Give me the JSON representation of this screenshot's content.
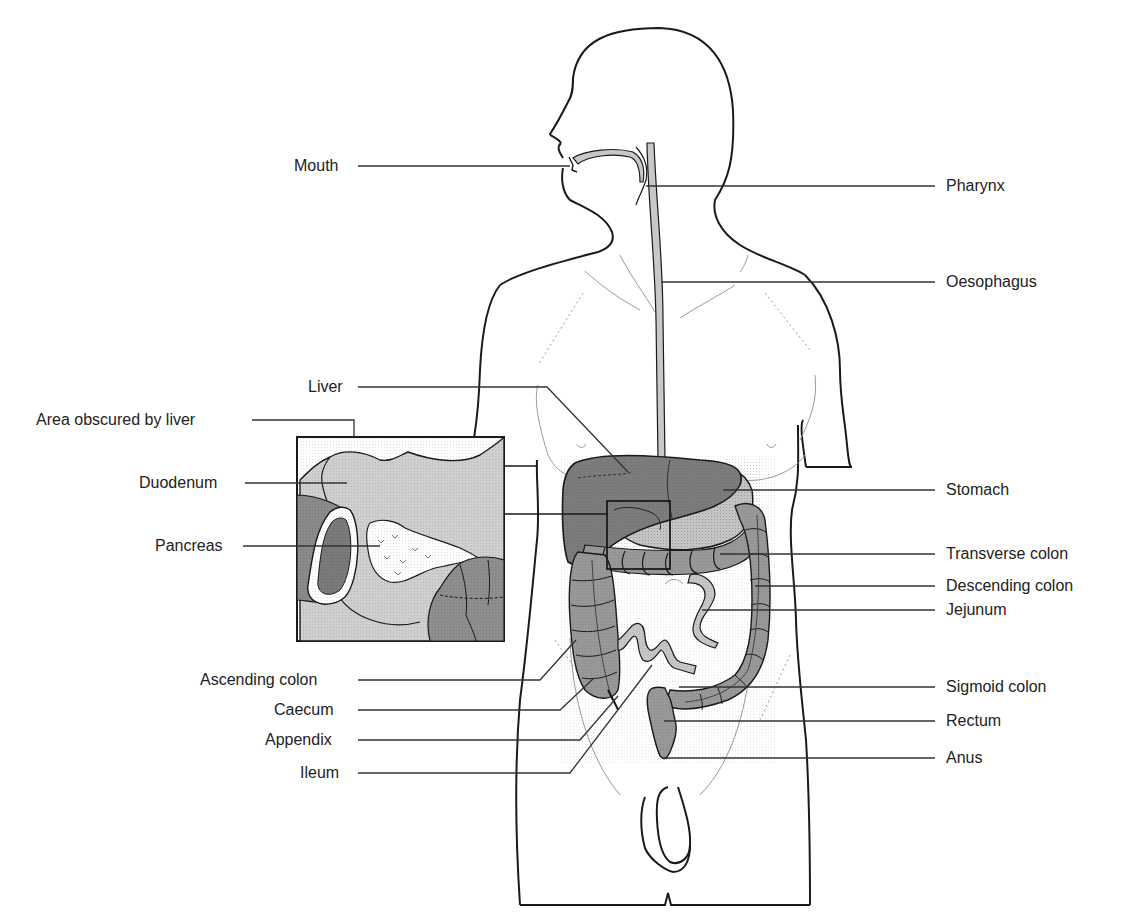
{
  "colors": {
    "outline": "#1a1a1a",
    "skin_detail": "#9a9a9a",
    "oesophagus": "#c8c8c8",
    "liver": "#7c7c7c",
    "stomach": "#c4c4c4",
    "colon": "#989898",
    "small_intestine": "#c6c6c6",
    "inset_bg": "#cfcfcf",
    "pancreas": "#ffffff",
    "leader": "#333333"
  },
  "labels_left": [
    {
      "id": "mouth",
      "text": "Mouth"
    },
    {
      "id": "liver",
      "text": "Liver"
    },
    {
      "id": "area-obscured",
      "text": "Area obscured by liver"
    },
    {
      "id": "duodenum",
      "text": "Duodenum"
    },
    {
      "id": "pancreas",
      "text": "Pancreas"
    },
    {
      "id": "ascending-colon",
      "text": "Ascending colon"
    },
    {
      "id": "caecum",
      "text": "Caecum"
    },
    {
      "id": "appendix",
      "text": "Appendix"
    },
    {
      "id": "ileum",
      "text": "Ileum"
    }
  ],
  "labels_right": [
    {
      "id": "pharynx",
      "text": "Pharynx"
    },
    {
      "id": "oesophagus",
      "text": "Oesophagus"
    },
    {
      "id": "stomach",
      "text": "Stomach"
    },
    {
      "id": "transverse-colon",
      "text": "Transverse colon"
    },
    {
      "id": "descending-colon",
      "text": "Descending colon"
    },
    {
      "id": "jejunum",
      "text": "Jejunum"
    },
    {
      "id": "sigmoid-colon",
      "text": "Sigmoid colon"
    },
    {
      "id": "rectum",
      "text": "Rectum"
    },
    {
      "id": "anus",
      "text": "Anus"
    }
  ]
}
